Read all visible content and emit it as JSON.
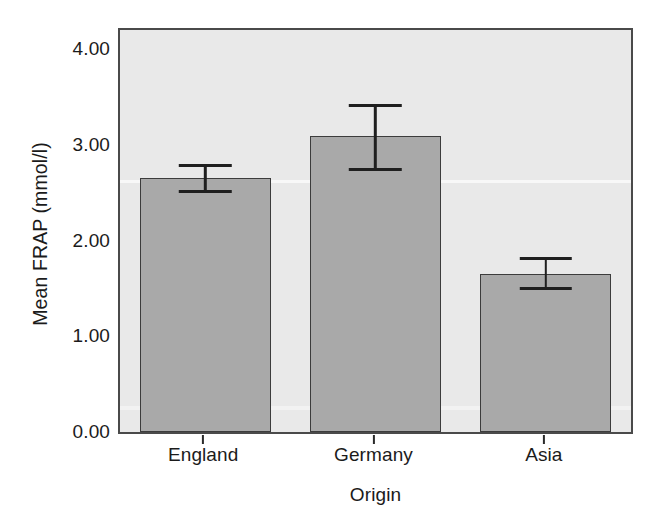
{
  "chart_data": {
    "type": "bar",
    "title": "",
    "subtitle": "",
    "xlabel": "Origin",
    "ylabel": "Mean FRAP (mmol/l)",
    "categories": [
      "England",
      "Germany",
      "Asia"
    ],
    "values": [
      2.65,
      3.09,
      1.65
    ],
    "errors_low": [
      2.5,
      2.73,
      1.48
    ],
    "errors_high": [
      2.8,
      3.43,
      1.83
    ],
    "error_type": "95% CI",
    "ylim": [
      0.0,
      4.2
    ],
    "ytick_labels": [
      "0.00",
      "1.00",
      "2.00",
      "3.00",
      "4.00"
    ],
    "ytick_values": [
      0.0,
      1.0,
      2.0,
      3.0,
      4.0
    ],
    "grid": false,
    "legend": "none",
    "series": [
      {
        "name": "Mean FRAP",
        "values": [
          2.65,
          3.09,
          1.65
        ],
        "errors_low": [
          2.5,
          2.73,
          1.48
        ],
        "errors_high": [
          2.8,
          3.43,
          1.83
        ]
      }
    ],
    "colors": {
      "bar_fill": "#a9a9a9",
      "bar_edge": "#3c3c3c",
      "panel_background": "#e9e9e9",
      "frame": "#4a4a4a",
      "error_bar": "#1f1f1f",
      "text": "#1b1b1b",
      "figure_background": "#ffffff"
    }
  }
}
